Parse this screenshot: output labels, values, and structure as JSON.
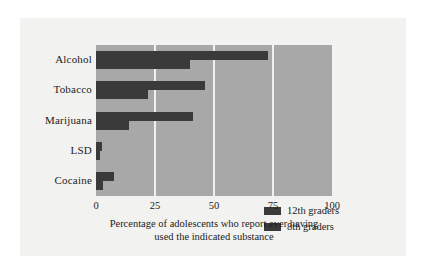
{
  "figure": {
    "background_color": "#ffffff",
    "card_color": "#f2f2f0",
    "plot_background_color": "#a8a8a8",
    "bar_color": "#3a3a3a",
    "gridline_color": "#f0f0ee",
    "caption_line_1": "Percentage of adolescents who report ever having",
    "caption_line_2": "used the indicated substance"
  },
  "legend": {
    "position": "inside-lower-center",
    "entries": [
      {
        "label": "12th graders",
        "color": "#3a3a3a"
      },
      {
        "label": "8th graders",
        "color": "#3a3a3a"
      }
    ]
  },
  "axis": {
    "x_tick_labels": [
      "0",
      "25",
      "50",
      "75",
      "100"
    ],
    "x_tick_values": [
      0,
      25,
      50,
      75,
      100
    ]
  },
  "categories": [
    {
      "label": "Alcohol"
    },
    {
      "label": "Tobacco"
    },
    {
      "label": "Marijuana"
    },
    {
      "label": "LSD"
    },
    {
      "label": "Cocaine"
    }
  ],
  "chart_data": {
    "type": "bar",
    "orientation": "horizontal",
    "title": "",
    "subtitle": "",
    "xlabel": "Percentage of adolescents who report ever having used the indicated substance",
    "ylabel": "",
    "xlim": [
      0,
      100
    ],
    "xticks": [
      0,
      25,
      50,
      75,
      100
    ],
    "grid": "vertical",
    "legend_position": "inside-lower-center",
    "categories": [
      "Alcohol",
      "Tobacco",
      "Marijuana",
      "LSD",
      "Cocaine"
    ],
    "series": [
      {
        "name": "12th graders",
        "color": "#3a3a3a",
        "values": [
          73,
          46,
          41,
          2.5,
          7.5
        ]
      },
      {
        "name": "8th graders",
        "color": "#3a3a3a",
        "values": [
          40,
          22,
          14,
          1.5,
          3
        ]
      }
    ]
  }
}
